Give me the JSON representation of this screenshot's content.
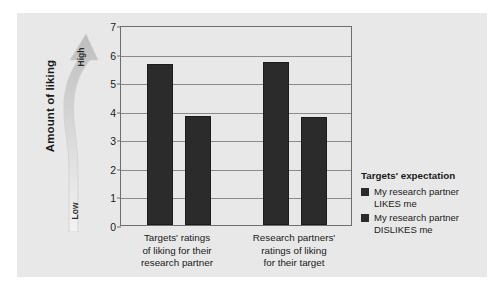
{
  "chart_data": {
    "type": "bar",
    "title": "",
    "xlabel": "",
    "ylabel": "Amount of liking",
    "ylim": [
      0,
      7
    ],
    "yticks": [
      "0",
      "1",
      "2",
      "3",
      "4",
      "5",
      "6",
      "7"
    ],
    "grid": true,
    "legend_position": "right",
    "categories": [
      "Targets' ratings of liking for their research partner",
      "Research partners' ratings of liking for their target"
    ],
    "category_lines": [
      [
        "Targets' ratings",
        "of liking for their",
        "research partner"
      ],
      [
        "Research partners'",
        "ratings of liking",
        "for their target"
      ]
    ],
    "series": [
      {
        "name": "My research partner LIKES me",
        "values": [
          5.65,
          5.7
        ],
        "color": "#2b2b2b"
      },
      {
        "name": "My research partner DISLIKES me",
        "values": [
          3.8,
          3.78
        ],
        "color": "#2b2b2b"
      }
    ],
    "legend_title": "Targets' expectation",
    "legend_entries": [
      {
        "line1": "My research partner",
        "line2": "LIKES me",
        "color": "#2b2b2b"
      },
      {
        "line1": "My research partner",
        "line2": "DISLIKES me",
        "color": "#2b2b2b"
      }
    ],
    "axis_arrow": {
      "high_label": "High",
      "low_label": "Low"
    },
    "colors": {
      "panel": "#e8e8e8",
      "bar": "#2b2b2b",
      "grid": "#8a8a8a",
      "frame": "#6e6e6e"
    }
  }
}
